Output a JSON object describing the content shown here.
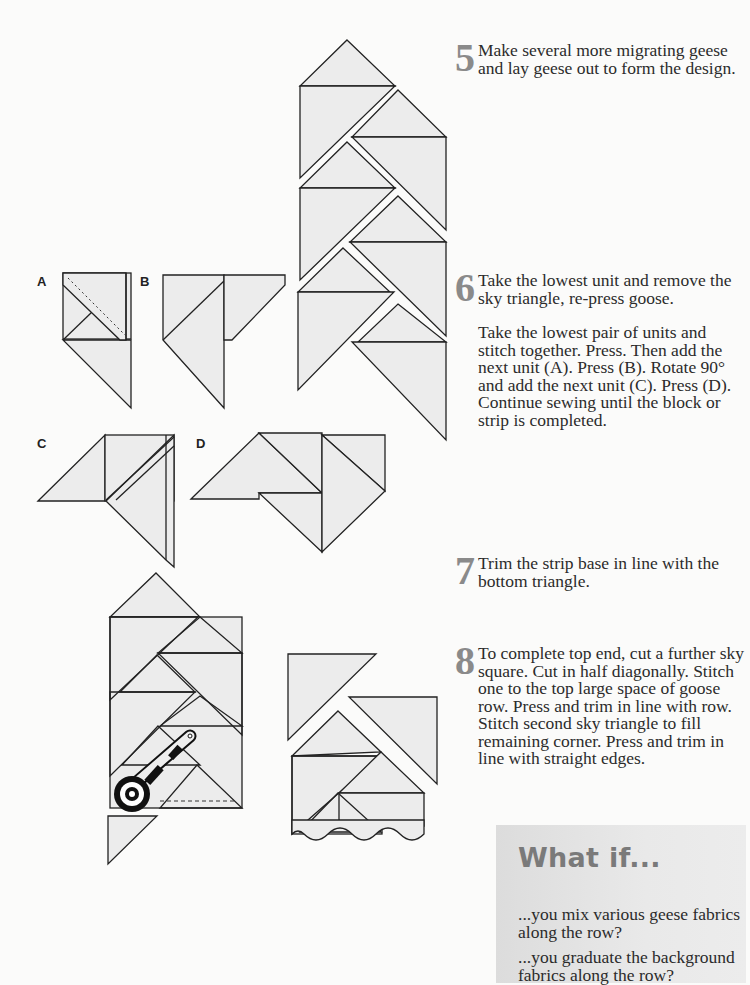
{
  "steps": [
    {
      "number": "5",
      "paragraphs": [
        "Make several more migrating geese and lay geese out to form the design."
      ]
    },
    {
      "number": "6",
      "paragraphs": [
        "Take the lowest unit and remove the sky triangle, re-press goose.",
        "Take the lowest pair of units and stitch together. Press. Then add the next unit (A). Press (B). Rotate 90° and add the next unit (C). Press (D). Continue sewing until the block or strip is completed."
      ]
    },
    {
      "number": "7",
      "paragraphs": [
        "Trim the strip base in line with the bottom triangle."
      ]
    },
    {
      "number": "8",
      "paragraphs": [
        "To complete top end, cut a further sky square. Cut in half diagonally. Stitch one to the top large space of goose row. Press and trim in line with row. Stitch second sky triangle to fill remaining corner. Press and trim in line with straight edges."
      ]
    }
  ],
  "figure_labels": {
    "a": "A",
    "b": "B",
    "c": "C",
    "d": "D"
  },
  "what_if": {
    "title": "What if...",
    "items": [
      "...you mix various geese fabrics along the row?",
      "...you graduate the background fabrics along the row?"
    ]
  },
  "colors": {
    "fabric": "#ececec",
    "outline": "#222222",
    "step_number": "#8a8a8a",
    "sidebar_bg": "#e4e4e4",
    "sidebar_title": "#7a7a7a"
  }
}
